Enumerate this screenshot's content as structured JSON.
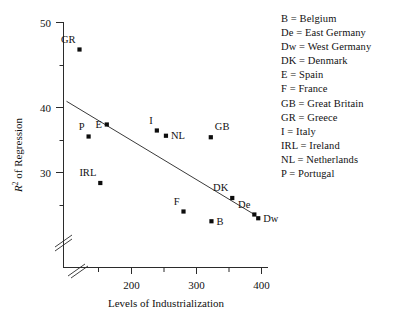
{
  "chart_data": {
    "type": "scatter",
    "title": "",
    "xlabel": "Levels of Industrialization",
    "ylabel": "R² of Regression",
    "ylabel_parts": {
      "symbol": "R",
      "sup": "2",
      "rest": " of Regression"
    },
    "xlim": [
      100,
      420
    ],
    "ylim": [
      23,
      51
    ],
    "xticks": [
      200,
      300,
      400
    ],
    "xticks_labels": [
      "200",
      "300",
      "400"
    ],
    "yticks": [
      30,
      40,
      50
    ],
    "yticks_labels": [
      "30",
      "40",
      "50"
    ],
    "minor_yticks": [
      25,
      35,
      45
    ],
    "grid": false,
    "axis_break_x": true,
    "axis_break_y": true,
    "legend_position": "right-outside",
    "points": [
      {
        "label": "GR",
        "x": 120,
        "y": 46.4,
        "label_pos": "above-left"
      },
      {
        "label": "E",
        "x": 162,
        "y": 36.4,
        "label_pos": "left"
      },
      {
        "label": "P",
        "x": 134,
        "y": 34.8,
        "label_pos": "above-left"
      },
      {
        "label": "I",
        "x": 239,
        "y": 35.6,
        "label_pos": "above-left"
      },
      {
        "label": "NL",
        "x": 253,
        "y": 34.9,
        "label_pos": "right"
      },
      {
        "label": "GB",
        "x": 322,
        "y": 34.7,
        "label_pos": "above-right"
      },
      {
        "label": "IRL",
        "x": 152,
        "y": 28.6,
        "label_pos": "above-left"
      },
      {
        "label": "DK",
        "x": 355,
        "y": 26.6,
        "label_pos": "above-left"
      },
      {
        "label": "F",
        "x": 280,
        "y": 24.8,
        "label_pos": "above-left"
      },
      {
        "label": "De",
        "x": 389,
        "y": 24.4,
        "label_pos": "above-left"
      },
      {
        "label": "Dw",
        "x": 395,
        "y": 23.9,
        "label_pos": "right"
      },
      {
        "label": "B",
        "x": 323,
        "y": 23.5,
        "label_pos": "right"
      }
    ],
    "regression_line": {
      "x0": 100,
      "y0": 39.5,
      "x1": 389,
      "y1": 24.4
    }
  },
  "legend": {
    "entries": [
      "B = Belgium",
      "De = East Germany",
      "Dw = West Germany",
      "DK = Denmark",
      "E = Spain",
      "F = France",
      "GB = Great Britain",
      "GR = Greece",
      "I = Italy",
      "IRL = Ireland",
      "NL = Netherlands",
      "P = Portugal"
    ]
  }
}
